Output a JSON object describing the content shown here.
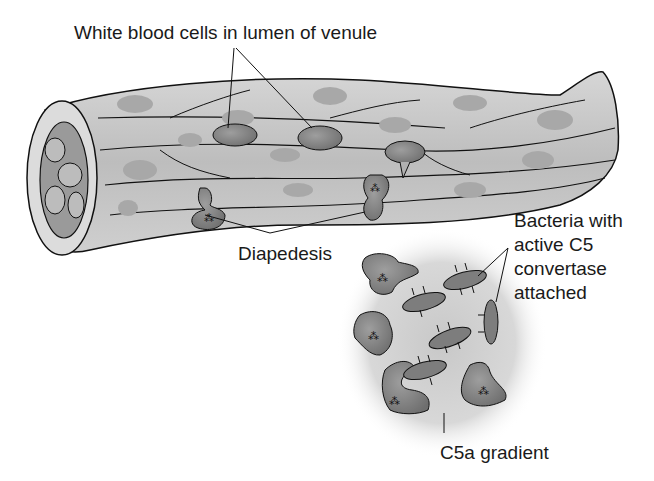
{
  "diagram": {
    "labels": {
      "wbc": "White blood cells in lumen of venule",
      "diapedesis": "Diapedesis",
      "bacteria_line1": "Bacteria with",
      "bacteria_line2": "active C5",
      "bacteria_line3": "convertase",
      "bacteria_line4": "attached",
      "gradient": "C5a gradient"
    },
    "colors": {
      "vessel_fill": "#c4c4c4",
      "vessel_stroke": "#111111",
      "nucleus_faint": "#a8a8a8",
      "wbc_fill": "#8a8a8a",
      "gradient_center": "#cfcfcf",
      "bacteria_fill": "#7d7d7d"
    }
  }
}
